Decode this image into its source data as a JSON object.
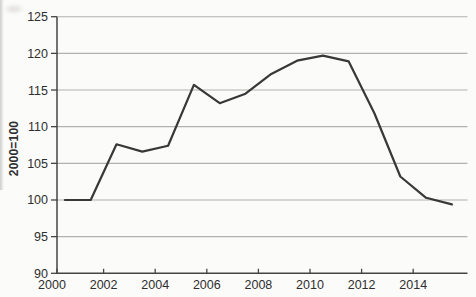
{
  "chart_data": {
    "type": "line",
    "title": "",
    "xlabel": "",
    "ylabel": "2000=100",
    "x": [
      2000,
      2001,
      2002,
      2003,
      2004,
      2005,
      2006,
      2007,
      2008,
      2009,
      2010,
      2011,
      2012,
      2013,
      2014,
      2015
    ],
    "values": [
      100.0,
      100.0,
      107.6,
      106.6,
      107.4,
      115.7,
      113.2,
      114.5,
      117.2,
      119.0,
      119.7,
      118.9,
      111.8,
      103.2,
      100.3,
      99.4
    ],
    "series_name": "index-2000-100",
    "x_plot_offset": 0.5,
    "xlim": [
      2000,
      2016.2
    ],
    "ylim": [
      90,
      125
    ],
    "yticks": [
      90,
      95,
      100,
      105,
      110,
      115,
      120,
      125
    ],
    "xticks": [
      2000,
      2002,
      2004,
      2006,
      2008,
      2010,
      2012,
      2014
    ],
    "grid": "horizontal",
    "legend": "none",
    "colors": {
      "line": "#383838",
      "grid": "#b3b1ae",
      "axis": "#454545",
      "tick_label": "#2e2e2e",
      "background": "#fbfbf9"
    }
  }
}
